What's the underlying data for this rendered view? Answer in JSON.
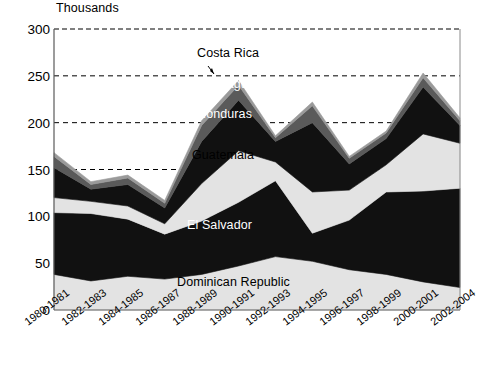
{
  "chart_data": {
    "type": "area",
    "title": "",
    "unit_label": "Thousands",
    "xlabel": "",
    "ylabel": "",
    "ylim": [
      0,
      300
    ],
    "yticks": [
      0,
      50,
      100,
      150,
      200,
      250,
      300
    ],
    "grid": true,
    "legend_position": "inline-annotations",
    "stacked": true,
    "categories": [
      "1980-1981",
      "1982-1983",
      "1984-1985",
      "1986-1987",
      "1988-1989",
      "1990-1991",
      "1992-1993",
      "1994-1995",
      "1996-1997",
      "1998-1999",
      "2000-2001",
      "2002-2004"
    ],
    "series": [
      {
        "name": "Dominican Republic",
        "color": "#e3e3e3",
        "values": [
          38,
          31,
          36,
          33,
          38,
          47,
          57,
          52,
          43,
          38,
          30,
          24
        ]
      },
      {
        "name": "El Salvador",
        "color": "#111111",
        "values": [
          66,
          72,
          61,
          48,
          57,
          68,
          81,
          30,
          53,
          88,
          97,
          106
        ]
      },
      {
        "name": "Guatemala",
        "color": "#e3e3e3",
        "values": [
          16,
          13,
          14,
          11,
          40,
          55,
          20,
          44,
          32,
          29,
          61,
          48
        ]
      },
      {
        "name": "Honduras",
        "color": "#111111",
        "values": [
          32,
          13,
          23,
          17,
          45,
          54,
          22,
          74,
          28,
          28,
          50,
          19
        ]
      },
      {
        "name": "Nicaragua",
        "color": "#5a5a5a",
        "values": [
          12,
          5,
          7,
          5,
          17,
          16,
          4,
          18,
          6,
          6,
          10,
          5
        ]
      },
      {
        "name": "Costa Rica",
        "color": "#9a9a9a",
        "values": [
          4,
          3,
          3,
          3,
          5,
          5,
          2,
          4,
          2,
          2,
          5,
          3
        ]
      }
    ],
    "totals": [
      168,
      137,
      144,
      117,
      202,
      245,
      186,
      222,
      164,
      191,
      253,
      205
    ],
    "annotations": [
      {
        "label": "Costa Rica",
        "leader": true
      },
      {
        "label": "Nicaragua",
        "leader": false
      },
      {
        "label": "Honduras",
        "leader": false
      },
      {
        "label": "Guatemala",
        "leader": false
      },
      {
        "label": "El Salvador",
        "leader": false
      },
      {
        "label": "Dominican Republic",
        "leader": false
      }
    ]
  },
  "axis": {
    "y_labels": [
      "300",
      "250",
      "200",
      "150",
      "100",
      "50",
      "0"
    ],
    "unit": "Thousands"
  },
  "x_labels": [
    "1980-1981",
    "1982-1983",
    "1984-1985",
    "1986-1987",
    "1988-1989",
    "1990-1991",
    "1992-1993",
    "1994-1995",
    "1996-1997",
    "1998-1999",
    "2000-2001",
    "2002-2004"
  ],
  "series_labels": {
    "costa_rica": "Costa Rica",
    "nicaragua": "Nicaragua",
    "honduras": "Honduras",
    "guatemala": "Guatemala",
    "el_salvador": "El Salvador",
    "dominican_republic": "Dominican Republic"
  }
}
